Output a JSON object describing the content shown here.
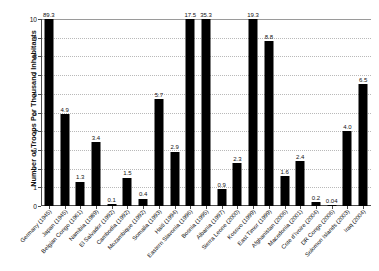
{
  "chart_data": {
    "type": "bar",
    "title": "",
    "xlabel": "",
    "ylabel": "Number of Troops Per Thousand Inhabitants",
    "ylim": [
      0,
      10
    ],
    "yticks": [
      "0",
      "1",
      "2",
      "3",
      "4",
      "5",
      "6",
      "7",
      "8",
      "9",
      "10"
    ],
    "grid": true,
    "legend": "none",
    "note": "Bars exceeding the y-axis maximum of 10 are truncated at the top and annotated with their true value.",
    "categories": [
      "Germany (1945)",
      "Japan (1945)",
      "Belgian Congo (1961)",
      "Namibia (1989)",
      "El Salvador (1992)",
      "Cambodia (1992)",
      "Mozambique (1992)",
      "Somalia (1993)",
      "Haiti (1994)",
      "Eastern Slavonia (1996)",
      "Bosnia (1995)",
      "Albania (1997)",
      "Sierra Leone (2000)",
      "Kosovo (1999)",
      "East Timor (1999)",
      "Afghanistan (2006)",
      "Macedonia (2001)",
      "Cote d'Ivoire (2004)",
      "DR Congo (2006)",
      "Solomon Islands (2003)",
      "Iraq (2004)"
    ],
    "values": [
      89.3,
      4.9,
      1.3,
      3.4,
      0.1,
      1.5,
      0.4,
      5.7,
      2.9,
      17.5,
      35.3,
      0.9,
      2.3,
      19.3,
      8.8,
      1.6,
      2.4,
      0.2,
      0.04,
      4.0,
      6.5
    ],
    "data_labels": [
      "89.3",
      "4.9",
      "1.3",
      "3.4",
      "0.1",
      "1.5",
      "0.4",
      "5.7",
      "2.9",
      "17.5",
      "35.3",
      "0.9",
      "2.3",
      "19.3",
      "8.8",
      "1.6",
      "2.4",
      "0.2",
      "0.04",
      "4.0",
      "6.5"
    ],
    "bar_color": "#000000"
  }
}
